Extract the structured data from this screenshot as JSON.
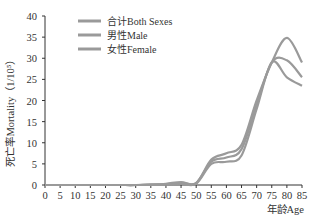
{
  "chart_data": {
    "type": "line",
    "title": "",
    "xlabel": "年龄Age",
    "ylabel": "死亡率Mortality（1/10⁵）",
    "xlim": [
      0,
      85
    ],
    "ylim": [
      0,
      40
    ],
    "xticks": [
      0,
      5,
      10,
      15,
      20,
      25,
      30,
      35,
      40,
      45,
      50,
      55,
      60,
      65,
      70,
      75,
      80,
      85
    ],
    "yticks": [
      0,
      5,
      10,
      15,
      20,
      25,
      30,
      35,
      40
    ],
    "grid": false,
    "legend_position": "upper left",
    "x": [
      0,
      5,
      10,
      15,
      20,
      25,
      30,
      35,
      40,
      45,
      50,
      55,
      60,
      65,
      70,
      75,
      80,
      85
    ],
    "series": [
      {
        "name": "合计Both Sexes",
        "values": [
          0,
          0,
          0,
          0,
          0,
          0,
          0,
          0.1,
          0.2,
          0.5,
          0.5,
          5.5,
          6.5,
          8.5,
          19,
          29,
          29.5,
          25.5
        ]
      },
      {
        "name": "男性Male",
        "values": [
          0,
          0,
          0,
          0,
          0,
          0,
          0,
          0.1,
          0.3,
          0.7,
          0.4,
          6,
          7.5,
          9.5,
          20,
          29,
          34.8,
          29
        ]
      },
      {
        "name": "女性Female",
        "values": [
          0,
          0,
          0,
          0,
          0,
          0,
          0,
          0.1,
          0.1,
          0.3,
          0.3,
          5,
          5.5,
          7,
          18,
          29,
          25.5,
          23.5
        ]
      }
    ],
    "line_color": "#9a9a9a"
  },
  "legend": {
    "items": [
      "合计Both Sexes",
      "男性Male",
      "女性Female"
    ]
  },
  "axes": {
    "xlabel": "年龄Age",
    "ylabel": "死亡率Mortality（1/10⁵）"
  }
}
